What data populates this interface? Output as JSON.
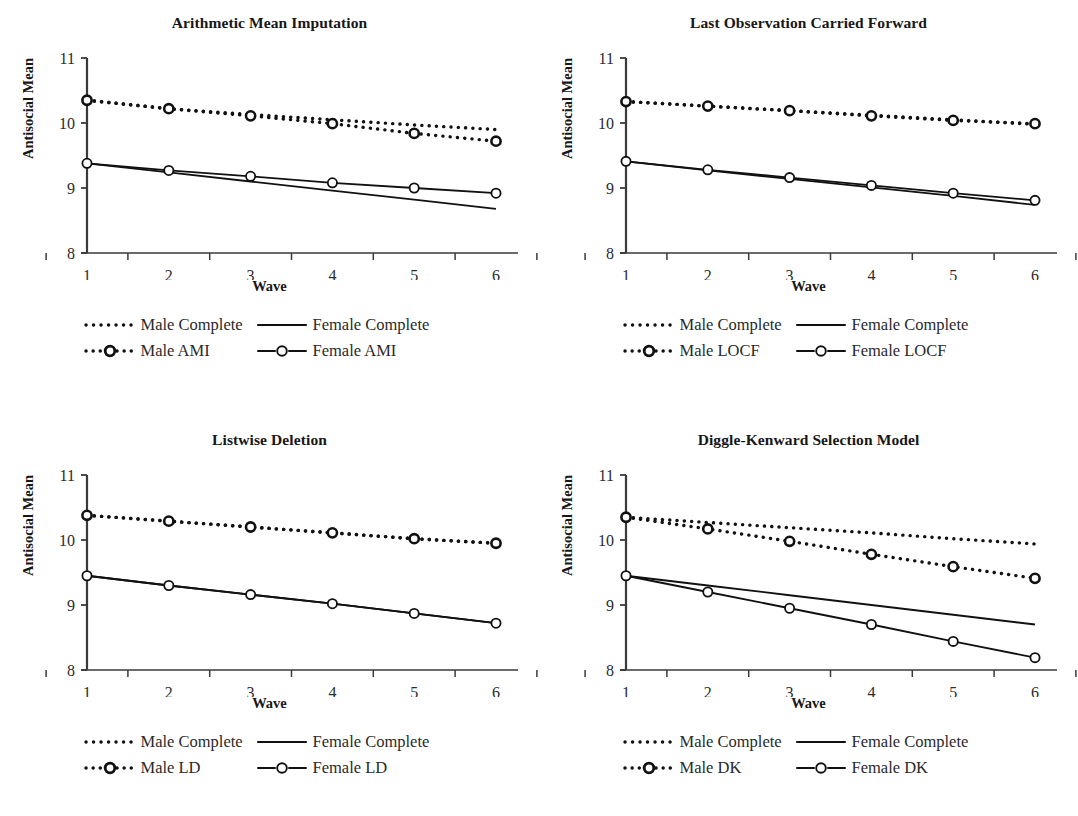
{
  "figure": {
    "axis_color": "#3a3a3a",
    "series_color": "#111111",
    "panel_layout": "2x2"
  },
  "common": {
    "xlabel": "Wave",
    "ylabel": "Antisocial Mean",
    "x_ticks": [
      "1",
      "2",
      "3",
      "4",
      "5",
      "6"
    ],
    "y_ticks": [
      "8",
      "9",
      "10",
      "11"
    ],
    "legend_male_complete": "Male Complete",
    "legend_female_complete": "Female Complete"
  },
  "chart_data": [
    {
      "type": "line",
      "panel": "top-left",
      "title": "Arithmetic Mean Imputation",
      "xlabel": "Wave",
      "ylabel": "Antisocial Mean",
      "x": [
        1,
        2,
        3,
        4,
        5,
        6
      ],
      "xlim": [
        1,
        6
      ],
      "ylim": [
        8,
        11
      ],
      "grid": false,
      "legend_position": "below",
      "series": [
        {
          "name": "Male Complete",
          "style": "dotted",
          "marker": "none",
          "values": [
            10.35,
            10.22,
            10.13,
            10.05,
            9.97,
            9.9
          ]
        },
        {
          "name": "Female Complete",
          "style": "solid",
          "marker": "none",
          "values": [
            9.38,
            9.24,
            9.1,
            8.96,
            8.82,
            8.68
          ]
        },
        {
          "name": "Male AMI",
          "style": "dotted",
          "marker": "circle",
          "values": [
            10.35,
            10.22,
            10.11,
            9.99,
            9.84,
            9.72
          ]
        },
        {
          "name": "Female AMI",
          "style": "solid",
          "marker": "circle",
          "values": [
            9.38,
            9.27,
            9.18,
            9.08,
            9.0,
            8.92
          ]
        }
      ]
    },
    {
      "type": "line",
      "panel": "top-right",
      "title": "Last Observation Carried Forward",
      "xlabel": "Wave",
      "ylabel": "Antisocial Mean",
      "x": [
        1,
        2,
        3,
        4,
        5,
        6
      ],
      "xlim": [
        1,
        6
      ],
      "ylim": [
        8,
        11
      ],
      "grid": false,
      "legend_position": "below",
      "series": [
        {
          "name": "Male Complete",
          "style": "dotted",
          "marker": "none",
          "values": [
            10.33,
            10.26,
            10.19,
            10.12,
            10.05,
            9.98
          ]
        },
        {
          "name": "Female Complete",
          "style": "solid",
          "marker": "none",
          "values": [
            9.41,
            9.27,
            9.14,
            9.01,
            8.88,
            8.74
          ]
        },
        {
          "name": "Male LOCF",
          "style": "dotted",
          "marker": "circle",
          "values": [
            10.33,
            10.26,
            10.19,
            10.11,
            10.04,
            9.99
          ]
        },
        {
          "name": "Female LOCF",
          "style": "solid",
          "marker": "circle",
          "values": [
            9.41,
            9.28,
            9.16,
            9.04,
            8.92,
            8.81
          ]
        }
      ]
    },
    {
      "type": "line",
      "panel": "bottom-left",
      "title": "Listwise Deletion",
      "xlabel": "Wave",
      "ylabel": "Antisocial Mean",
      "x": [
        1,
        2,
        3,
        4,
        5,
        6
      ],
      "xlim": [
        1,
        6
      ],
      "ylim": [
        8,
        11
      ],
      "grid": false,
      "legend_position": "below",
      "series": [
        {
          "name": "Male Complete",
          "style": "dotted",
          "marker": "none",
          "values": [
            10.38,
            10.29,
            10.2,
            10.11,
            10.02,
            9.95
          ]
        },
        {
          "name": "Female Complete",
          "style": "solid",
          "marker": "none",
          "values": [
            9.45,
            9.3,
            9.16,
            9.02,
            8.87,
            8.72
          ]
        },
        {
          "name": "Male LD",
          "style": "dotted",
          "marker": "circle",
          "values": [
            10.38,
            10.29,
            10.2,
            10.11,
            10.02,
            9.95
          ]
        },
        {
          "name": "Female LD",
          "style": "solid",
          "marker": "circle",
          "values": [
            9.45,
            9.3,
            9.16,
            9.02,
            8.87,
            8.72
          ]
        }
      ]
    },
    {
      "type": "line",
      "panel": "bottom-right",
      "title": "Diggle-Kenward Selection Model",
      "xlabel": "Wave",
      "ylabel": "Antisocial Mean",
      "x": [
        1,
        2,
        3,
        4,
        5,
        6
      ],
      "xlim": [
        1,
        6
      ],
      "ylim": [
        8,
        11
      ],
      "grid": false,
      "legend_position": "below",
      "series": [
        {
          "name": "Male Complete",
          "style": "dotted",
          "marker": "none",
          "values": [
            10.35,
            10.27,
            10.19,
            10.11,
            10.02,
            9.94
          ]
        },
        {
          "name": "Female Complete",
          "style": "solid",
          "marker": "none",
          "values": [
            9.45,
            9.3,
            9.15,
            9.0,
            8.85,
            8.7
          ]
        },
        {
          "name": "Male DK",
          "style": "dotted",
          "marker": "circle",
          "values": [
            10.35,
            10.17,
            9.98,
            9.78,
            9.59,
            9.41
          ]
        },
        {
          "name": "Female DK",
          "style": "solid",
          "marker": "circle",
          "values": [
            9.45,
            9.2,
            8.95,
            8.7,
            8.44,
            8.19
          ]
        }
      ]
    }
  ],
  "panels": [
    {
      "id": "top-left",
      "title": "Arithmetic Mean Imputation",
      "legend": [
        {
          "label": "Male Complete",
          "key": "dotted"
        },
        {
          "label": "Female Complete",
          "key": "solid"
        },
        {
          "label": "Male AMI",
          "key": "dotted-marker"
        },
        {
          "label": "Female AMI",
          "key": "solid-marker"
        }
      ]
    },
    {
      "id": "top-right",
      "title": "Last Observation Carried Forward",
      "legend": [
        {
          "label": "Male Complete",
          "key": "dotted"
        },
        {
          "label": "Female Complete",
          "key": "solid"
        },
        {
          "label": "Male LOCF",
          "key": "dotted-marker"
        },
        {
          "label": "Female LOCF",
          "key": "solid-marker"
        }
      ]
    },
    {
      "id": "bottom-left",
      "title": "Listwise Deletion",
      "legend": [
        {
          "label": "Male Complete",
          "key": "dotted"
        },
        {
          "label": "Female Complete",
          "key": "solid"
        },
        {
          "label": "Male LD",
          "key": "dotted-marker"
        },
        {
          "label": "Female LD",
          "key": "solid-marker"
        }
      ]
    },
    {
      "id": "bottom-right",
      "title": "Diggle-Kenward Selection Model",
      "legend": [
        {
          "label": "Male Complete",
          "key": "dotted"
        },
        {
          "label": "Female Complete",
          "key": "solid"
        },
        {
          "label": "Male DK",
          "key": "dotted-marker"
        },
        {
          "label": "Female DK",
          "key": "solid-marker"
        }
      ]
    }
  ]
}
